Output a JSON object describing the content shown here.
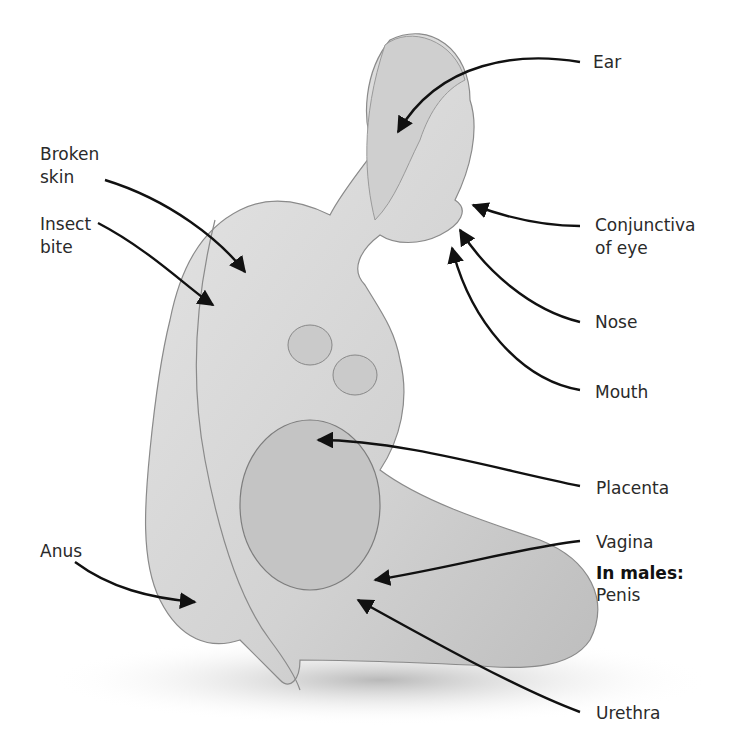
{
  "figure": {
    "labels": {
      "ear": "Ear",
      "broken_skin_1": "Broken",
      "broken_skin_2": "skin",
      "insect_bite_1": "Insect",
      "insect_bite_2": "bite",
      "conjunctiva_1": "Conjunctiva",
      "conjunctiva_2": "of eye",
      "nose": "Nose",
      "mouth": "Mouth",
      "placenta": "Placenta",
      "vagina": "Vagina",
      "in_males": "In males:",
      "penis": "Penis",
      "anus": "Anus",
      "urethra": "Urethra"
    }
  }
}
